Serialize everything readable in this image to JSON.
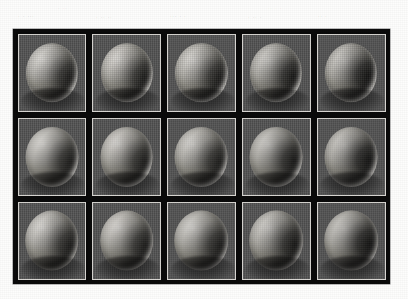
{
  "page": {
    "background_color": "#fdfdfc",
    "kind": "scanned-paper-figure"
  },
  "caption_artifacts": {
    "note": "faint illegible scanned text above the figure",
    "lines": [
      "  .  .  ...  ",
      " .   ..  .. ",
      "  ... .  .  ",
      " .   .. . ",
      "  ..  . ",
      " . .. ",
      " .. . . "
    ]
  },
  "figure": {
    "frame_color": "#0b0b0b",
    "tile_border_color": "#d8d6d2",
    "tile_background_color": "#535353",
    "rows": 3,
    "columns": 5,
    "tiles": [
      [
        {
          "name": "sphere-r1c1"
        },
        {
          "name": "sphere-r1c2"
        },
        {
          "name": "sphere-r1c3"
        },
        {
          "name": "sphere-r1c4"
        },
        {
          "name": "sphere-r1c5"
        }
      ],
      [
        {
          "name": "sphere-r2c1"
        },
        {
          "name": "sphere-r2c2"
        },
        {
          "name": "sphere-r2c3"
        },
        {
          "name": "sphere-r2c4"
        },
        {
          "name": "sphere-r2c5"
        }
      ],
      [
        {
          "name": "sphere-r3c1"
        },
        {
          "name": "sphere-r3c2"
        },
        {
          "name": "sphere-r3c3"
        },
        {
          "name": "sphere-r3c4"
        },
        {
          "name": "sphere-r3c5"
        }
      ]
    ]
  }
}
